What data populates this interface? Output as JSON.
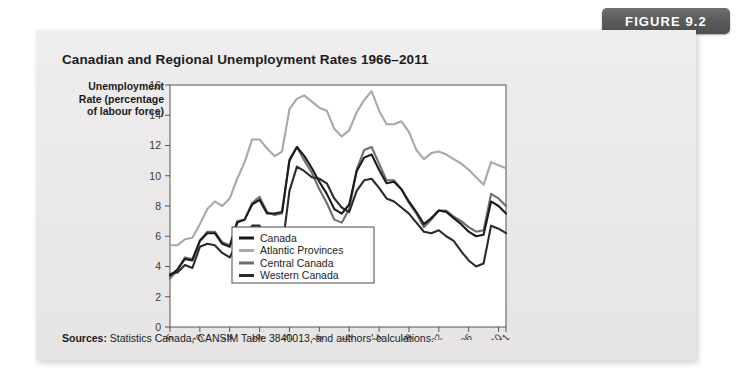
{
  "figure": {
    "tab_label": "FIGURE 9.2",
    "title": "Canadian and Regional Unemployment Rates 1966–2011",
    "sources_prefix": "Sources:",
    "sources_text": " Statistics Canada, CANSIM Table 3840013, and authors' calculations."
  },
  "colors": {
    "card_background": "#ebe9e9",
    "tab_background": "#5c5c5c",
    "plot_background": "#ffffff",
    "canada": "#1a1a1a",
    "atlantic": "#a8a8a8",
    "central": "#6e6e6e",
    "western": "#2b2b2b",
    "axis": "#555555"
  },
  "chart_data": {
    "type": "line",
    "title": "Canadian and Regional Unemployment Rates 1966–2011",
    "xlabel": "",
    "ylabel": "Unemployment Rate (percentage of labour force)",
    "ylabel_lines": [
      "Unemployment",
      "Rate (percentage",
      "of labour force)"
    ],
    "ylim": [
      0,
      16
    ],
    "yticks": [
      0,
      2,
      4,
      6,
      8,
      10,
      12,
      14,
      16
    ],
    "xlim": [
      1966,
      2011
    ],
    "xticks": [
      1966,
      1970,
      1974,
      1978,
      1982,
      1986,
      1990,
      1994,
      1998,
      2002,
      2006,
      2010,
      2011
    ],
    "xtick_labels": [
      "1966",
      "1970",
      "1974",
      "1978",
      "1982",
      "1986",
      "1990",
      "1994",
      "1998",
      "2002",
      "2006",
      "2010",
      "2011"
    ],
    "grid": false,
    "legend_position": "inside-bottom-center",
    "x": [
      1966,
      1967,
      1968,
      1969,
      1970,
      1971,
      1972,
      1973,
      1974,
      1975,
      1976,
      1977,
      1978,
      1979,
      1980,
      1981,
      1982,
      1983,
      1984,
      1985,
      1986,
      1987,
      1988,
      1989,
      1990,
      1991,
      1992,
      1993,
      1994,
      1995,
      1996,
      1997,
      1998,
      1999,
      2000,
      2001,
      2002,
      2003,
      2004,
      2005,
      2006,
      2007,
      2008,
      2009,
      2010,
      2011
    ],
    "series": [
      {
        "name": "Canada",
        "color": "#1a1a1a",
        "values": [
          3.4,
          3.8,
          4.5,
          4.4,
          5.7,
          6.2,
          6.2,
          5.5,
          5.3,
          6.9,
          7.1,
          8.1,
          8.4,
          7.5,
          7.5,
          7.6,
          11.0,
          11.9,
          11.3,
          10.5,
          9.6,
          8.8,
          7.8,
          7.5,
          8.1,
          10.3,
          11.2,
          11.4,
          10.4,
          9.5,
          9.6,
          9.1,
          8.3,
          7.6,
          6.8,
          7.2,
          7.7,
          7.6,
          7.2,
          6.8,
          6.3,
          6.0,
          6.1,
          8.3,
          8.0,
          7.5
        ]
      },
      {
        "name": "Atlantic Provinces",
        "color": "#a8a8a8",
        "values": [
          5.4,
          5.4,
          5.8,
          5.9,
          6.8,
          7.8,
          8.3,
          8.0,
          8.5,
          9.8,
          10.9,
          12.4,
          12.4,
          11.8,
          11.3,
          11.6,
          14.4,
          15.1,
          15.3,
          14.9,
          14.5,
          14.3,
          13.1,
          12.6,
          13.0,
          14.2,
          15.0,
          15.6,
          14.3,
          13.4,
          13.4,
          13.6,
          12.9,
          11.7,
          11.1,
          11.5,
          11.6,
          11.4,
          11.1,
          10.8,
          10.4,
          9.9,
          9.4,
          10.9,
          10.7,
          10.5
        ]
      },
      {
        "name": "Central Canada",
        "color": "#6e6e6e",
        "values": [
          3.2,
          3.8,
          4.6,
          4.5,
          5.7,
          6.3,
          6.3,
          5.6,
          5.4,
          7.0,
          7.1,
          8.2,
          8.6,
          7.6,
          7.4,
          7.5,
          11.1,
          11.9,
          11.0,
          10.2,
          9.1,
          8.2,
          7.1,
          6.9,
          7.8,
          10.4,
          11.7,
          11.9,
          10.8,
          9.7,
          9.7,
          9.1,
          8.2,
          7.5,
          6.6,
          7.1,
          7.7,
          7.7,
          7.3,
          7.0,
          6.6,
          6.3,
          6.4,
          8.8,
          8.5,
          8.0
        ]
      },
      {
        "name": "Western Canada",
        "color": "#2b2b2b",
        "values": [
          3.5,
          3.6,
          4.1,
          3.9,
          5.3,
          5.5,
          5.4,
          4.9,
          4.6,
          5.6,
          5.8,
          6.7,
          6.7,
          5.3,
          5.4,
          5.1,
          9.0,
          10.6,
          10.3,
          9.9,
          9.8,
          9.5,
          8.5,
          7.9,
          7.6,
          9.0,
          9.7,
          9.8,
          9.2,
          8.5,
          8.3,
          7.9,
          7.5,
          6.9,
          6.3,
          6.2,
          6.4,
          6.0,
          5.7,
          5.0,
          4.4,
          4.0,
          4.2,
          6.7,
          6.5,
          6.2
        ]
      }
    ],
    "legend": [
      {
        "label": "Canada",
        "color": "#1a1a1a",
        "width": 3
      },
      {
        "label": "Atlantic Provinces",
        "color": "#a8a8a8",
        "width": 3
      },
      {
        "label": "Central Canada",
        "color": "#6e6e6e",
        "width": 3
      },
      {
        "label": "Western Canada",
        "color": "#2b2b2b",
        "width": 3
      }
    ]
  }
}
